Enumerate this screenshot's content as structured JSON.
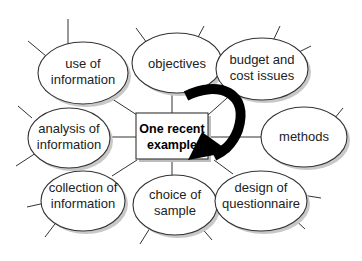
{
  "diagram": {
    "type": "mind-map",
    "center": {
      "line1": "One recent",
      "line2": "example"
    },
    "nodes": [
      {
        "id": "use",
        "line1": "use of",
        "line2": "information"
      },
      {
        "id": "objectives",
        "line1": "objectives",
        "line2": ""
      },
      {
        "id": "budget",
        "line1": "budget and",
        "line2": "cost issues"
      },
      {
        "id": "analysis",
        "line1": "analysis of",
        "line2": "information"
      },
      {
        "id": "methods",
        "line1": "methods",
        "line2": ""
      },
      {
        "id": "collection",
        "line1": "collection of",
        "line2": "information"
      },
      {
        "id": "choice",
        "line1": "choice of",
        "line2": "sample"
      },
      {
        "id": "design",
        "line1": "design of",
        "line2": "questionnaire"
      }
    ],
    "arrow": {
      "color": "#000000",
      "direction": "clockwise-curve-down-left"
    }
  }
}
